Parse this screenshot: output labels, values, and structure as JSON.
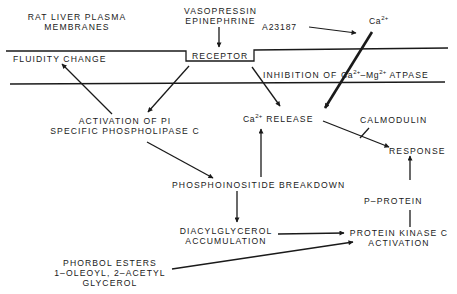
{
  "diagram": {
    "title_lines": [
      "RAT LIVER PLASMA",
      "MEMBRANES"
    ],
    "hormones": [
      "VASOPRESSIN",
      "EPINEPHRINE"
    ],
    "ionophore": "A23187",
    "calcium": {
      "base": "Ca",
      "charge": "2+"
    },
    "membrane_labels": {
      "fluidity_change": "FLUIDITY CHANGE",
      "receptor": "RECEPTOR",
      "inhibition_prefix": "INHIBITION OF ",
      "inhibition_mg_base": "–Mg",
      "inhibition_suffix": " ATPASE"
    },
    "nodes": {
      "pi_plc": [
        "ACTIVATION OF PI",
        "SPECIFIC PHOSPHOLIPASE C"
      ],
      "ca_release": "RELEASE",
      "calmodulin": "CALMODULIN",
      "response": "RESPONSE",
      "pi_breakdown": "PHOSPHOINOSITIDE BREAKDOWN",
      "p_protein": "P–PROTEIN",
      "dag": [
        "DIACYLGLYCEROL",
        "ACCUMULATION"
      ],
      "pkc": [
        "PROTEIN KINASE C",
        "ACTIVATION"
      ],
      "phorbol": [
        "PHORBOL ESTERS",
        "1–OLEOYL, 2–ACETYL",
        "GLYCEROL"
      ]
    },
    "edges": [
      {
        "from": "hormones",
        "to": "receptor"
      },
      {
        "from": "receptor",
        "to": "pi_plc"
      },
      {
        "from": "receptor",
        "to": "ca_release"
      },
      {
        "from": "pi_plc",
        "to": "fluidity_change"
      },
      {
        "from": "pi_plc",
        "to": "pi_breakdown"
      },
      {
        "from": "pi_breakdown",
        "to": "ca_release"
      },
      {
        "from": "pi_breakdown",
        "to": "dag"
      },
      {
        "from": "ionophore",
        "to": "calcium"
      },
      {
        "from": "calcium",
        "to": "ca_release"
      },
      {
        "from": "ca_release",
        "to": "response"
      },
      {
        "from": "calmodulin",
        "to": "response"
      },
      {
        "from": "dag",
        "to": "pkc"
      },
      {
        "from": "phorbol",
        "to": "pkc"
      },
      {
        "from": "pkc",
        "to": "p_protein"
      },
      {
        "from": "p_protein",
        "to": "response"
      }
    ],
    "colors": {
      "ink": "#1a1a1a",
      "background": "#ffffff"
    }
  }
}
